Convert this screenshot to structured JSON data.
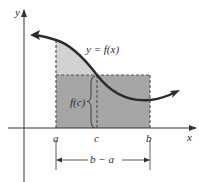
{
  "diagram": {
    "axes": {
      "x_label": "x",
      "y_label": "y"
    },
    "curve_label": "y = f(x)",
    "points": {
      "a": "a",
      "c": "c",
      "b": "b"
    },
    "height_label": "f(c)",
    "width_label": "b − a",
    "colors": {
      "axis": "#333333",
      "curve": "#2b2b2b",
      "rect_fill": "#a6a6a6",
      "under_curve_fill": "#d2d2d2",
      "dash": "#555555"
    }
  }
}
